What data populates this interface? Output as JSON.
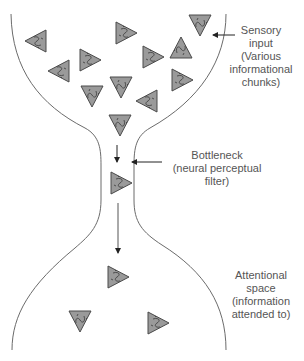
{
  "diagram": {
    "type": "bottleneck-filter-model",
    "colors": {
      "outline": "#6b6b6b",
      "chunk_fill": "#9a9a9a",
      "chunk_stroke": "#4a4a4a",
      "arrow": "#222222",
      "text": "#555555"
    },
    "labels": {
      "sensory": [
        "Sensory",
        "input",
        "(Various",
        "informational",
        "chunks)"
      ],
      "bottleneck": [
        "Bottleneck",
        "(neural perceptual",
        "filter)"
      ],
      "attention": [
        "Attentional",
        "space",
        "(information",
        "attended to)"
      ]
    },
    "chunks": [
      {
        "x": 37,
        "y": 41,
        "dir": "left"
      },
      {
        "x": 60,
        "y": 71,
        "dir": "left"
      },
      {
        "x": 89,
        "y": 60,
        "dir": "right"
      },
      {
        "x": 125,
        "y": 33,
        "dir": "right"
      },
      {
        "x": 152,
        "y": 57,
        "dir": "right"
      },
      {
        "x": 181,
        "y": 49,
        "dir": "up"
      },
      {
        "x": 200,
        "y": 24,
        "dir": "down"
      },
      {
        "x": 181,
        "y": 80,
        "dir": "right"
      },
      {
        "x": 92,
        "y": 95,
        "dir": "down"
      },
      {
        "x": 121,
        "y": 86,
        "dir": "down"
      },
      {
        "x": 148,
        "y": 101,
        "dir": "left"
      },
      {
        "x": 120,
        "y": 124,
        "dir": "down"
      },
      {
        "x": 120,
        "y": 183,
        "dir": "right"
      },
      {
        "x": 117,
        "y": 277,
        "dir": "right"
      },
      {
        "x": 80,
        "y": 320,
        "dir": "down"
      },
      {
        "x": 157,
        "y": 323,
        "dir": "right"
      }
    ]
  }
}
